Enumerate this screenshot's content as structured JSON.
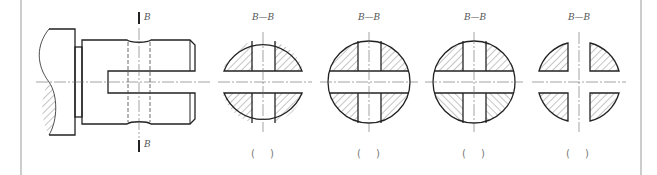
{
  "figure": {
    "type": "engineering-drawing",
    "main_view": {
      "section_label_top": "B",
      "section_label_bottom": "B"
    },
    "options": [
      {
        "title": "B—B",
        "answer_blank": "(   )",
        "variant": "solid-top-bottom-cut"
      },
      {
        "title": "B—B",
        "answer_blank": "(   )",
        "variant": "full-circle-same-hatch"
      },
      {
        "title": "B—B",
        "answer_blank": "(   )",
        "variant": "full-circle-opposite-hatch"
      },
      {
        "title": "B—B",
        "answer_blank": "(   )",
        "variant": "four-quadrants"
      }
    ],
    "colors": {
      "line": "#222222",
      "centerline": "#666666",
      "hatch": "#555555",
      "border": "#999999"
    }
  }
}
